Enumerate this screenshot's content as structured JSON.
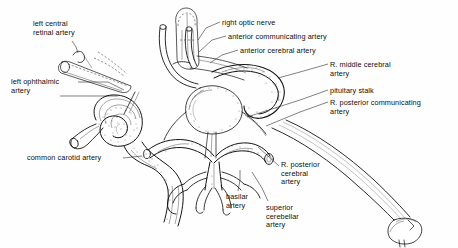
{
  "figure": {
    "medium": "pen-and-ink line drawing",
    "background_color": "#ffffff",
    "ink_color": "#141312",
    "width": 458,
    "height": 248
  },
  "labels": [
    {
      "id": "left-central-retinal-artery",
      "text": "left central\nretinal artery",
      "lines": [
        "left central",
        "retinal artery"
      ],
      "x": 33,
      "y": 20,
      "align": "left"
    },
    {
      "id": "right-optic-nerve",
      "text": "right optic nerve",
      "lines": [
        "right optic nerve"
      ],
      "x": 222,
      "y": 19,
      "align": "left"
    },
    {
      "id": "anterior-communicating-artery",
      "text": "anterior communicating artery",
      "lines": [
        "anterior communicating artery"
      ],
      "x": 228,
      "y": 33,
      "align": "left"
    },
    {
      "id": "anterior-cerebral-artery",
      "text": "anterior cerebral artery",
      "lines": [
        "anterior cerebral artery"
      ],
      "x": 240,
      "y": 47,
      "align": "left"
    },
    {
      "id": "r-middle-cerebral-artery",
      "text": "R. middle cerebral\nartery",
      "lines": [
        "R. middle cerebral",
        "artery"
      ],
      "x": 330,
      "y": 61,
      "align": "left"
    },
    {
      "id": "pituitary-stalk",
      "text": "pituitary stalk",
      "lines": [
        "pituitary stalk"
      ],
      "x": 330,
      "y": 87,
      "align": "left"
    },
    {
      "id": "r-posterior-communicating-artery",
      "text": "R. posterior communicating\nartery",
      "lines": [
        "R. posterior communicating",
        "artery"
      ],
      "x": 330,
      "y": 99,
      "align": "left"
    },
    {
      "id": "left-ophthalmic-artery",
      "text": "left ophthalmic\nartery",
      "lines": [
        "left ophthalmic",
        "artery"
      ],
      "x": 11,
      "y": 78,
      "align": "left"
    },
    {
      "id": "common-carotid-artery",
      "text": "common carotid artery",
      "lines": [
        "common carotid artery"
      ],
      "x": 27,
      "y": 154,
      "align": "left"
    },
    {
      "id": "r-posterior-cerebral-artery",
      "text": "R. posterior\ncerebral\nartery",
      "lines": [
        "R. posterior",
        "cerebral",
        "artery"
      ],
      "x": 281,
      "y": 161,
      "align": "left"
    },
    {
      "id": "basilar-artery",
      "text": "basilar\nartery",
      "lines": [
        "basilar",
        "artery"
      ],
      "x": 226,
      "y": 193,
      "align": "left"
    },
    {
      "id": "superior-cerebellar-artery",
      "text": "superior\ncerebellar\nartery",
      "lines": [
        "superior",
        "cerebellar",
        "artery"
      ],
      "x": 266,
      "y": 204,
      "align": "left"
    }
  ],
  "structures": [
    {
      "id": "right-optic-nerve-stub",
      "description": "vertical rounded cylinder, dashed outline, upper center"
    },
    {
      "id": "left-optic-nerve-stub",
      "description": "cut cylindrical stub angled down-right, upper left"
    },
    {
      "id": "left-carotid-siphon",
      "description": "coiled internal carotid artery loop, left of center, heavy stipple shading"
    },
    {
      "id": "common-carotid-trunk",
      "description": "thick vessel descending from siphon to lower left"
    },
    {
      "id": "circle-of-willis",
      "description": "central arterial ring with anterior and posterior communicating branches"
    },
    {
      "id": "pituitary-gland",
      "description": "rounded stippled body below center of circle"
    },
    {
      "id": "basilar-artery-trunk",
      "description": "midline vessel ascending with paired symmetric branches, lower center"
    },
    {
      "id": "right-vertebral-artery",
      "description": "large tubular vessel sweeping to lower right, cut end"
    }
  ]
}
